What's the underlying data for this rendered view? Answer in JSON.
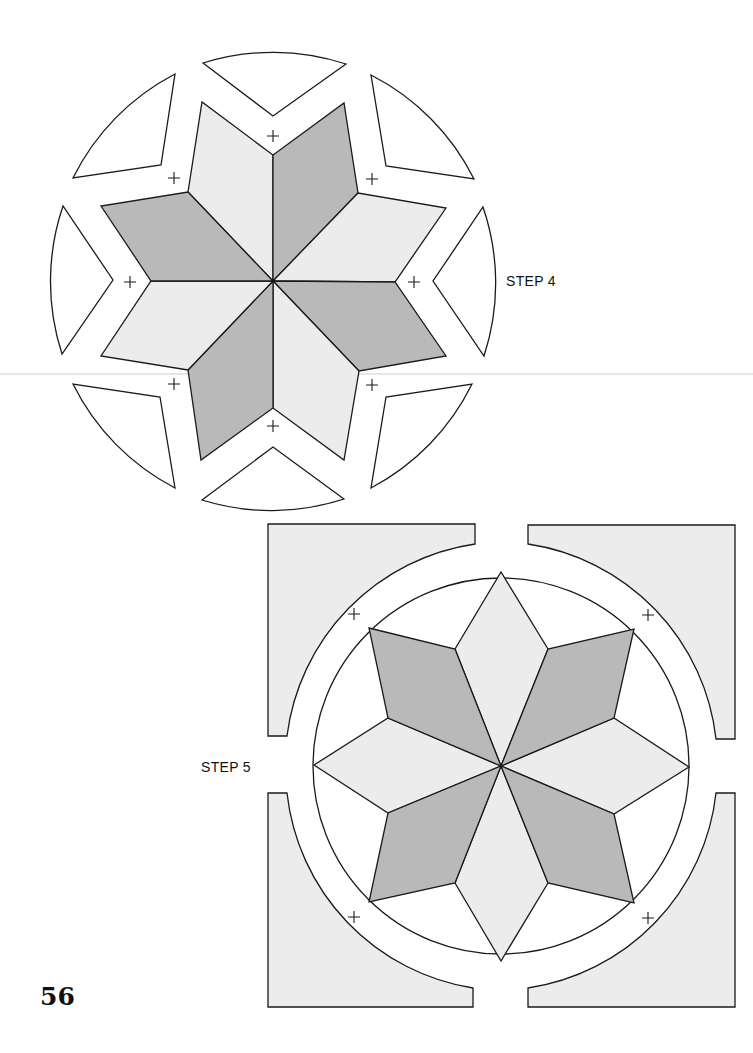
{
  "page": {
    "number": "56",
    "background": "#ffffff"
  },
  "colors": {
    "dark_fabric": "#b9b9b9",
    "light_fabric": "#ececec",
    "outline": "#1a1a1a",
    "blank": "#ffffff"
  },
  "step4": {
    "label": "STEP 4",
    "center": [
      273,
      281
    ],
    "description": "Eight-point star of alternating light and dark diamonds with eight white wedge/corner background pieces separated outward, registration marks (+) at each joint",
    "registration_marks": 8
  },
  "step5": {
    "label": "STEP 5",
    "center": [
      501,
      766
    ],
    "description": "Assembled eight-point star inside circle, surrounded by four light gray corner pieces with concave arcs, registration marks (+) at four diagonals",
    "registration_marks": 4
  }
}
